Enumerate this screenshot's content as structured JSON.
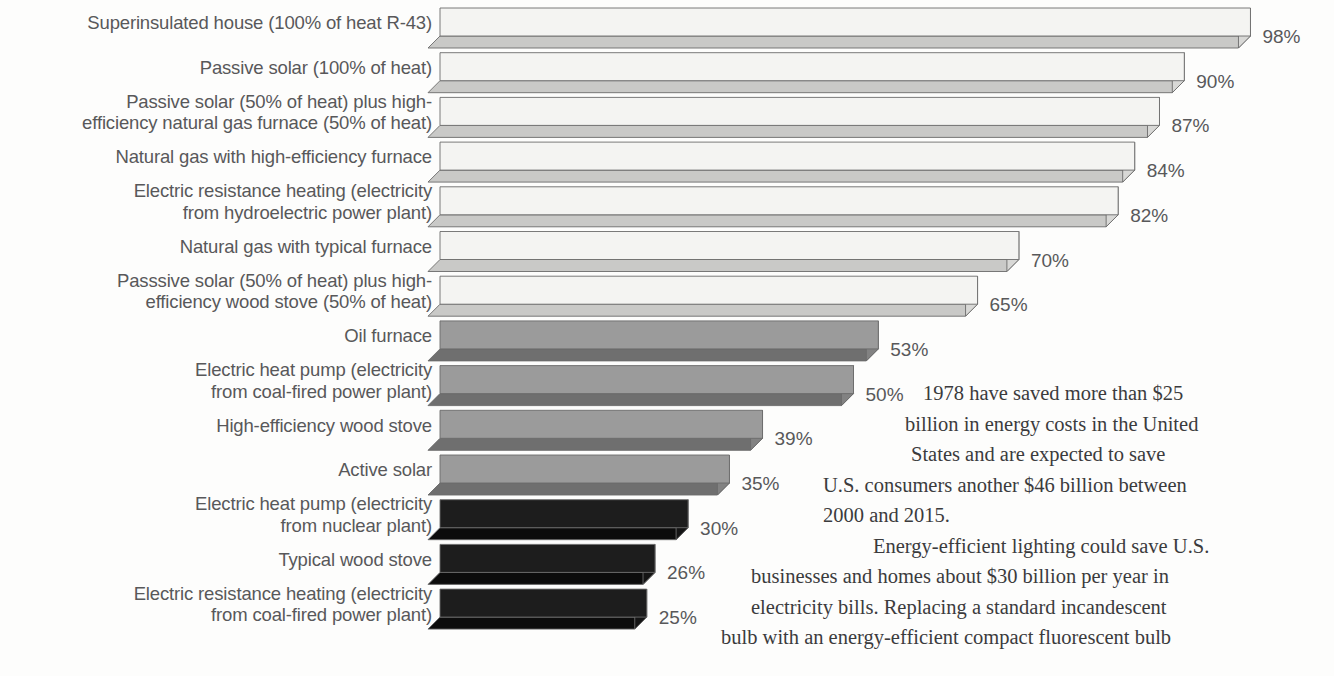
{
  "chart_data": {
    "type": "bar",
    "orientation": "horizontal",
    "title": "",
    "xlabel": "",
    "ylabel": "",
    "xlim": [
      0,
      100
    ],
    "value_suffix": "%",
    "grid": false,
    "legend": false,
    "categories": [
      "Superinsulated house (100% of heat R-43)",
      "Passive solar (100% of heat)",
      "Passive solar (50% of heat) plus high-\nefficiency natural gas furnace (50% of heat)",
      "Natural gas with high-efficiency furnace",
      "Electric resistance heating (electricity\nfrom hydroelectric power plant)",
      "Natural gas with typical furnace",
      "Passsive solar (50% of heat) plus high-\nefficiency wood stove (50% of heat)",
      "Oil furnace",
      "Electric heat pump (electricity\nfrom coal-fired power plant)",
      "High-efficiency wood stove",
      "Active solar",
      "Electric heat pump (electricity\nfrom nuclear plant)",
      "Typical wood stove",
      "Electric resistance heating (electricity\nfrom coal-fired power plant)"
    ],
    "values": [
      98,
      90,
      87,
      84,
      82,
      70,
      65,
      53,
      50,
      39,
      35,
      30,
      26,
      25
    ],
    "value_labels": [
      "98%",
      "90%",
      "87%",
      "84%",
      "82%",
      "70%",
      "65%",
      "53%",
      "50%",
      "39%",
      "35%",
      "30%",
      "26%",
      "25%"
    ],
    "shade_groups": [
      "light",
      "light",
      "light",
      "light",
      "light",
      "light",
      "light",
      "medium",
      "medium",
      "medium",
      "medium",
      "dark",
      "dark",
      "dark"
    ],
    "colors": {
      "light_top": "#f4f4f2",
      "light_side": "#c9c9c7",
      "light_end": "#d8d8d6",
      "medium_top": "#9b9b9b",
      "medium_side": "#6f6f6f",
      "medium_end": "#828282",
      "dark_top": "#1d1d1d",
      "dark_side": "#0c0c0c",
      "dark_end": "#141414",
      "outline": "#6b6b6b",
      "label_text": "#58585a",
      "background": "#fdfdfc"
    }
  },
  "body_copy": {
    "paragraphs": [
      {
        "indent": false,
        "lines": [
          "1978 have saved more than $25",
          "billion in energy costs in the United",
          "States and are expected to save",
          "U.S. consumers another $46 billion between",
          "2000 and 2015."
        ]
      },
      {
        "indent": true,
        "lines": [
          "Energy-efficient lighting could save U.S.",
          "businesses and homes about $30 billion per year in",
          "electricity bills. Replacing a standard incandescent",
          "bulb with an energy-efficient compact fluorescent bulb"
        ]
      }
    ]
  }
}
